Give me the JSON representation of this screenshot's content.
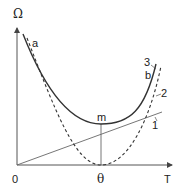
{
  "diagram": {
    "y_axis_label": "Ω",
    "x_axis_label": "T",
    "origin_label": "0",
    "theta_label": "θ",
    "point_m_label": "m",
    "curve_labels": {
      "a": "a",
      "b": "b",
      "one": "1",
      "two": "2",
      "three": "3"
    },
    "colors": {
      "axis": "#555555",
      "solid_curve": "#333333",
      "dashed_curve": "#333333",
      "line": "#666666"
    }
  }
}
